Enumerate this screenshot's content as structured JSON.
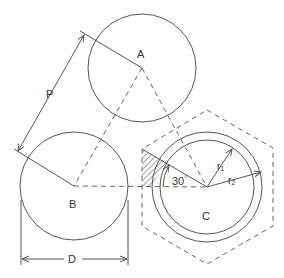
{
  "diagram": {
    "labels": {
      "A": "A",
      "B": "B",
      "C": "C",
      "P": "P",
      "D": "D",
      "r1": "r",
      "r1_sub": "1",
      "r2": "r",
      "r2_sub": "2",
      "angle": "30",
      "angle_unit": "°"
    },
    "colors": {
      "line": "#555555",
      "dashed": "#666666",
      "text": "#333333",
      "background": "#ffffff"
    }
  }
}
